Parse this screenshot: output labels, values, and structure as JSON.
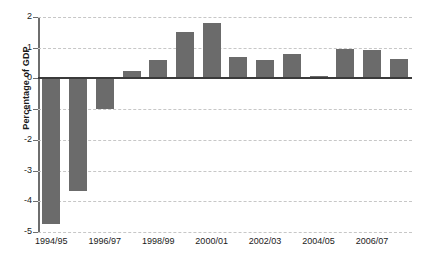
{
  "chart_data": {
    "type": "bar",
    "title": "",
    "xlabel": "",
    "ylabel": "Percentage of GDP",
    "categories": [
      "1994/95",
      "1995/96",
      "1996/97",
      "1997/98",
      "1998/99",
      "1999/00",
      "2000/01",
      "2001/02",
      "2002/03",
      "2003/04",
      "2004/05",
      "2005/06",
      "2006/07",
      "2007/08"
    ],
    "values": [
      -4.75,
      -3.65,
      -1.0,
      0.25,
      0.6,
      1.5,
      1.8,
      0.7,
      0.6,
      0.8,
      0.07,
      0.95,
      0.93,
      0.62
    ],
    "ylim": [
      -5,
      2
    ],
    "yticks": [
      2,
      1,
      0,
      -1,
      -2,
      -3,
      -4,
      -5
    ],
    "ytick_labels": [
      "2",
      "1",
      "0",
      "-1",
      "-2",
      "-3",
      "-4",
      "-5"
    ],
    "xtick_labels": [
      "1994/95",
      "1996/97",
      "1998/99",
      "2000/01",
      "2002/03",
      "2004/05",
      "2006/07"
    ],
    "xtick_indices": [
      0,
      2,
      4,
      6,
      8,
      10,
      12
    ],
    "grid": true,
    "grid_style": "dashed-horizontal",
    "legend": "none",
    "bar_color": "#6b6b6b",
    "grid_color": "#c7c7c7",
    "axis_color": "#6e6e6e",
    "zero_line_color": "#3a3a3a",
    "text_color": "#1a1a1a",
    "background": "#ffffff"
  }
}
